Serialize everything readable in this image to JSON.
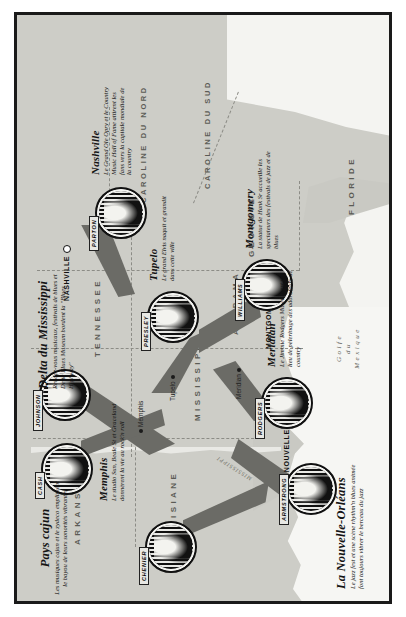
{
  "map": {
    "title": "Carte musicale du Sud des Etats-Unis",
    "gulf_label": "Golfe\ndu\nMexique",
    "river_label": "MISSISSIPPI"
  },
  "states": [
    {
      "name": "LOUISIANE"
    },
    {
      "name": "ARKANSAS"
    },
    {
      "name": "MISSISSIPPI"
    },
    {
      "name": "ALABAMA"
    },
    {
      "name": "TENNESSEE"
    },
    {
      "name": "GEORGIE"
    },
    {
      "name": "FLORIDE"
    },
    {
      "name": "CAROLINE DU NORD"
    },
    {
      "name": "CAROLINE DU SUD"
    }
  ],
  "cities": [
    {
      "name": "LA NOUVELLE-ORLÉANS",
      "type": "capital"
    },
    {
      "name": "Memphis",
      "type": "city"
    },
    {
      "name": "Tupelo",
      "type": "city"
    },
    {
      "name": "Meridian",
      "type": "city"
    },
    {
      "name": "MONTGOMERY",
      "type": "capital"
    },
    {
      "name": "NASHVILLE",
      "type": "capital"
    }
  ],
  "callouts": [
    {
      "id": "pays-cajun",
      "title": "Pays cajun",
      "body": "Les musiques cajun et le zydeco emplissent le bayou de leurs sonorités vibrantes",
      "portrait": "CHENIER"
    },
    {
      "id": "delta-du-mississippi",
      "title": "Delta du Mississippi",
      "body": "Rendez-vous musicaux, festivals de blues et Delta Blues Museum bordent la \"Blues Highway\"",
      "portrait": "JOHNSON"
    },
    {
      "id": "memphis",
      "title": "Memphis",
      "body": "Le studio Sun, Beale St et Graceland donnèrent la vie au rock'n roll",
      "portrait": "CASH"
    },
    {
      "id": "nashville",
      "title": "Nashville",
      "body": "Le Grand Ole Opry et le Country Music Hall of Fame attirent les fans vers la capitale mondiale de la country",
      "portrait": "PARTON"
    },
    {
      "id": "tupelo",
      "title": "Tupelo",
      "body": "Le grand Elvis naquit et grandit dans cette ville",
      "portrait": "PRESLEY"
    },
    {
      "id": "montgomery",
      "title": "Montgomery",
      "body": "La statue de Hank Sr accueille les spectateurs des festivals de jazz et de blues",
      "portrait": "WILLIAMS"
    },
    {
      "id": "meridian",
      "title": "Meridian",
      "body": "Le Jimmie Rodgers Museum est un lieu de pèlerinage des adorateurs de country",
      "portrait": "RODGERS"
    },
    {
      "id": "la-nouvelle-orleans",
      "title": "La Nouvelle-Orléans",
      "body": "Le jazz fest et une scène rhythm'n blues animée font toujours vibrer le berceau du jazz",
      "portrait": "ARMSTRONG"
    }
  ],
  "colors": {
    "land": "#c9c9c3",
    "water": "#f4f4f1",
    "cone": "#6b6b66",
    "ink": "#141414",
    "border": "#1a1a1a"
  }
}
